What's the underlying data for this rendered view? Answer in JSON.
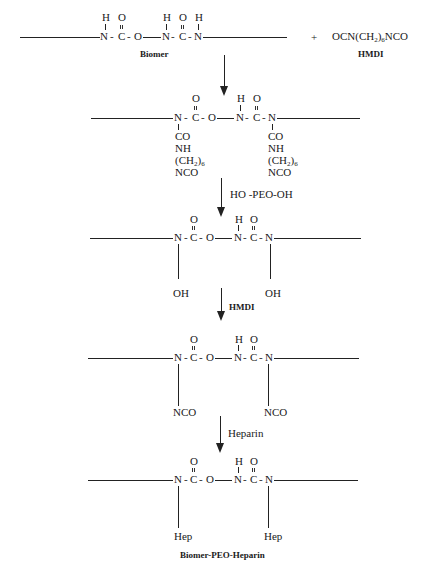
{
  "diagram": {
    "step1": {
      "backbone": [
        "N",
        "-",
        "C",
        "-",
        "O",
        "N",
        "-",
        "C",
        "-",
        "N"
      ],
      "atoms": {
        "h1": "H",
        "o1": "O",
        "h2": "H",
        "o2": "O",
        "h3": "H"
      },
      "n1": "N",
      "c1": "C",
      "o_ester": "O",
      "n2": "N",
      "c2": "C",
      "n3": "N",
      "dash": "-",
      "label": "Biomer",
      "plus": "+",
      "reagent_main": "OCN(CH",
      "reagent_sub1": "2",
      "reagent_paren": ")",
      "reagent_sub2": "6",
      "reagent_end": "NCO",
      "reagent_label": "HMDI"
    },
    "step2": {
      "o1": "O",
      "h": "H",
      "o2": "O",
      "n1": "N",
      "c1": "C",
      "o_ester": "O",
      "n2": "N",
      "c2": "C",
      "n3": "N",
      "dash": "-",
      "branch_left": [
        "CO",
        "NH",
        "(CH",
        "NCO"
      ],
      "branch_right": [
        "CO",
        "NH",
        "(CH",
        "NCO"
      ],
      "sub2": "2",
      "sub6": "6",
      "paren": ")"
    },
    "arrow2_label": "HO -PEO-OH",
    "step3": {
      "o1": "O",
      "h": "H",
      "o2": "O",
      "n1": "N",
      "c1": "C",
      "o_ester": "O",
      "n2": "N",
      "c2": "C",
      "n3": "N",
      "dash": "-",
      "pendant_left": "OH",
      "pendant_right": "OH"
    },
    "arrow3_label": "HMDI",
    "step4": {
      "o1": "O",
      "h": "H",
      "o2": "O",
      "n1": "N",
      "c1": "C",
      "o_ester": "O",
      "n2": "N",
      "c2": "C",
      "n3": "N",
      "dash": "-",
      "pendant_left": "NCO",
      "pendant_right": "NCO"
    },
    "arrow4_label": "Heparin",
    "step5": {
      "o1": "O",
      "h": "H",
      "o2": "O",
      "n1": "N",
      "c1": "C",
      "o_ester": "O",
      "n2": "N",
      "c2": "C",
      "n3": "N",
      "dash": "-",
      "pendant_left": "Hep",
      "pendant_right": "Hep",
      "label": "Biomer-PEO-Heparin"
    }
  }
}
